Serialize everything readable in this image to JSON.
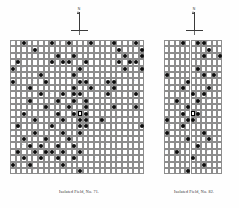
{
  "figure": {
    "background_color": "#ffffff",
    "grid_line_color": "#8d8d8d",
    "dot_color": "#0d0d0d",
    "focus_marker_color": "#000000",
    "caption_color": "#2b2b2b"
  },
  "panels": [
    {
      "id": "left",
      "caption": "Isolated Field, No. 71.",
      "north_arrow": {
        "label": "N",
        "icon": "north-arrow-icon"
      },
      "grid": {
        "columns": 24,
        "rows": 21,
        "cell_width": 5.6,
        "cell_height": 6.4,
        "origin_x": 0,
        "origin_y": 0
      },
      "focus_cell": {
        "col": 12,
        "row": 11
      },
      "cell_labels": [
        {
          "col": 0,
          "row": 0,
          "text": "a"
        },
        {
          "col": 3,
          "row": 0,
          "text": "b"
        },
        {
          "col": 6,
          "row": 0,
          "text": "c"
        },
        {
          "col": 9,
          "row": 0,
          "text": "d"
        },
        {
          "col": 14,
          "row": 0,
          "text": "e"
        },
        {
          "col": 18,
          "row": 0,
          "text": "f"
        },
        {
          "col": 21,
          "row": 0,
          "text": "g"
        },
        {
          "col": 1,
          "row": 2,
          "text": "h"
        },
        {
          "col": 5,
          "row": 2,
          "text": "i"
        },
        {
          "col": 11,
          "row": 2,
          "text": "j"
        },
        {
          "col": 16,
          "row": 2,
          "text": "k"
        },
        {
          "col": 20,
          "row": 2,
          "text": "l"
        },
        {
          "col": 2,
          "row": 4,
          "text": "m"
        },
        {
          "col": 8,
          "row": 4,
          "text": "n"
        },
        {
          "col": 13,
          "row": 4,
          "text": "o"
        },
        {
          "col": 19,
          "row": 4,
          "text": "p"
        },
        {
          "col": 0,
          "row": 6,
          "text": "q"
        },
        {
          "col": 4,
          "row": 6,
          "text": "r"
        },
        {
          "col": 10,
          "row": 6,
          "text": "s"
        },
        {
          "col": 17,
          "row": 6,
          "text": "t"
        },
        {
          "col": 22,
          "row": 6,
          "text": "u"
        },
        {
          "col": 2,
          "row": 8,
          "text": "v"
        },
        {
          "col": 7,
          "row": 8,
          "text": "w"
        },
        {
          "col": 15,
          "row": 8,
          "text": "x"
        },
        {
          "col": 20,
          "row": 8,
          "text": "y"
        },
        {
          "col": 1,
          "row": 10,
          "text": "z"
        },
        {
          "col": 6,
          "row": 10,
          "text": "a"
        },
        {
          "col": 16,
          "row": 10,
          "text": "b"
        },
        {
          "col": 21,
          "row": 10,
          "text": "c"
        },
        {
          "col": 3,
          "row": 12,
          "text": "d"
        },
        {
          "col": 9,
          "row": 12,
          "text": "e"
        },
        {
          "col": 14,
          "row": 12,
          "text": "f"
        },
        {
          "col": 19,
          "row": 12,
          "text": "g"
        },
        {
          "col": 0,
          "row": 14,
          "text": "h"
        },
        {
          "col": 5,
          "row": 14,
          "text": "i"
        },
        {
          "col": 12,
          "row": 14,
          "text": "j"
        },
        {
          "col": 18,
          "row": 14,
          "text": "k"
        },
        {
          "col": 22,
          "row": 14,
          "text": "l"
        },
        {
          "col": 2,
          "row": 16,
          "text": "m"
        },
        {
          "col": 8,
          "row": 16,
          "text": "n"
        },
        {
          "col": 13,
          "row": 16,
          "text": "o"
        },
        {
          "col": 17,
          "row": 16,
          "text": "p"
        },
        {
          "col": 21,
          "row": 16,
          "text": "q"
        },
        {
          "col": 1,
          "row": 18,
          "text": "r"
        },
        {
          "col": 6,
          "row": 18,
          "text": "s"
        },
        {
          "col": 11,
          "row": 18,
          "text": "t"
        },
        {
          "col": 15,
          "row": 18,
          "text": "u"
        },
        {
          "col": 19,
          "row": 18,
          "text": "v"
        },
        {
          "col": 4,
          "row": 20,
          "text": "w"
        },
        {
          "col": 10,
          "row": 20,
          "text": "x"
        },
        {
          "col": 16,
          "row": 20,
          "text": "y"
        }
      ],
      "marked_cells": [
        {
          "col": 2,
          "row": 0
        },
        {
          "col": 7,
          "row": 0
        },
        {
          "col": 10,
          "row": 0
        },
        {
          "col": 14,
          "row": 0
        },
        {
          "col": 18,
          "row": 0
        },
        {
          "col": 22,
          "row": 0
        },
        {
          "col": 4,
          "row": 1
        },
        {
          "col": 19,
          "row": 1
        },
        {
          "col": 23,
          "row": 1
        },
        {
          "col": 8,
          "row": 2
        },
        {
          "col": 11,
          "row": 2
        },
        {
          "col": 20,
          "row": 2
        },
        {
          "col": 23,
          "row": 2
        },
        {
          "col": 1,
          "row": 3
        },
        {
          "col": 7,
          "row": 3
        },
        {
          "col": 9,
          "row": 3
        },
        {
          "col": 10,
          "row": 3
        },
        {
          "col": 13,
          "row": 3
        },
        {
          "col": 19,
          "row": 3
        },
        {
          "col": 21,
          "row": 3
        },
        {
          "col": 22,
          "row": 3
        },
        {
          "col": 0,
          "row": 4
        },
        {
          "col": 12,
          "row": 4
        },
        {
          "col": 20,
          "row": 4
        },
        {
          "col": 23,
          "row": 4
        },
        {
          "col": 5,
          "row": 5
        },
        {
          "col": 11,
          "row": 5
        },
        {
          "col": 0,
          "row": 6
        },
        {
          "col": 6,
          "row": 6
        },
        {
          "col": 12,
          "row": 6
        },
        {
          "col": 13,
          "row": 6
        },
        {
          "col": 17,
          "row": 6
        },
        {
          "col": 18,
          "row": 6
        },
        {
          "col": 3,
          "row": 7
        },
        {
          "col": 11,
          "row": 7
        },
        {
          "col": 14,
          "row": 7
        },
        {
          "col": 18,
          "row": 7
        },
        {
          "col": 5,
          "row": 8
        },
        {
          "col": 9,
          "row": 8
        },
        {
          "col": 11,
          "row": 8
        },
        {
          "col": 12,
          "row": 8
        },
        {
          "col": 17,
          "row": 8
        },
        {
          "col": 22,
          "row": 8
        },
        {
          "col": 3,
          "row": 9
        },
        {
          "col": 8,
          "row": 9
        },
        {
          "col": 11,
          "row": 9
        },
        {
          "col": 13,
          "row": 9
        },
        {
          "col": 6,
          "row": 10
        },
        {
          "col": 10,
          "row": 10
        },
        {
          "col": 13,
          "row": 10
        },
        {
          "col": 18,
          "row": 10
        },
        {
          "col": 22,
          "row": 10
        },
        {
          "col": 2,
          "row": 11
        },
        {
          "col": 8,
          "row": 11
        },
        {
          "col": 11,
          "row": 11
        },
        {
          "col": 13,
          "row": 11
        },
        {
          "col": 4,
          "row": 12
        },
        {
          "col": 9,
          "row": 12
        },
        {
          "col": 12,
          "row": 12
        },
        {
          "col": 13,
          "row": 12
        },
        {
          "col": 16,
          "row": 12
        },
        {
          "col": 1,
          "row": 13
        },
        {
          "col": 7,
          "row": 13
        },
        {
          "col": 12,
          "row": 13
        },
        {
          "col": 13,
          "row": 13
        },
        {
          "col": 23,
          "row": 13
        },
        {
          "col": 4,
          "row": 14
        },
        {
          "col": 9,
          "row": 14
        },
        {
          "col": 12,
          "row": 14
        },
        {
          "col": 2,
          "row": 15
        },
        {
          "col": 6,
          "row": 15
        },
        {
          "col": 10,
          "row": 15
        },
        {
          "col": 3,
          "row": 16
        },
        {
          "col": 5,
          "row": 16
        },
        {
          "col": 8,
          "row": 16
        },
        {
          "col": 11,
          "row": 16
        },
        {
          "col": 1,
          "row": 17
        },
        {
          "col": 4,
          "row": 17
        },
        {
          "col": 6,
          "row": 17
        },
        {
          "col": 7,
          "row": 17
        },
        {
          "col": 9,
          "row": 17
        },
        {
          "col": 12,
          "row": 17
        },
        {
          "col": 2,
          "row": 18
        },
        {
          "col": 5,
          "row": 18
        },
        {
          "col": 8,
          "row": 18
        },
        {
          "col": 11,
          "row": 18
        },
        {
          "col": 0,
          "row": 19
        },
        {
          "col": 3,
          "row": 19
        },
        {
          "col": 9,
          "row": 19
        },
        {
          "col": 12,
          "row": 20
        }
      ]
    },
    {
      "id": "right",
      "caption": "Isolated Field, No. 82.",
      "north_arrow": {
        "label": "N",
        "icon": "north-arrow-icon"
      },
      "grid": {
        "columns": 11,
        "rows": 21,
        "cell_width": 5.3,
        "cell_height": 6.4,
        "origin_x": 0,
        "origin_y": 0
      },
      "focus_cell": {
        "col": 5,
        "row": 11
      },
      "cell_labels": [
        {
          "col": 0,
          "row": 1,
          "text": "a"
        },
        {
          "col": 8,
          "row": 0,
          "text": "b"
        },
        {
          "col": 2,
          "row": 3,
          "text": "c"
        },
        {
          "col": 6,
          "row": 3,
          "text": "d"
        },
        {
          "col": 0,
          "row": 5,
          "text": "e"
        },
        {
          "col": 3,
          "row": 5,
          "text": "f"
        },
        {
          "col": 7,
          "row": 5,
          "text": "g"
        },
        {
          "col": 1,
          "row": 7,
          "text": "h"
        },
        {
          "col": 5,
          "row": 7,
          "text": "i"
        },
        {
          "col": 9,
          "row": 7,
          "text": "j"
        },
        {
          "col": 0,
          "row": 9,
          "text": "k"
        },
        {
          "col": 4,
          "row": 9,
          "text": "l"
        },
        {
          "col": 8,
          "row": 9,
          "text": "m"
        },
        {
          "col": 2,
          "row": 11,
          "text": "n"
        },
        {
          "col": 7,
          "row": 11,
          "text": "o"
        },
        {
          "col": 1,
          "row": 13,
          "text": "p"
        },
        {
          "col": 5,
          "row": 13,
          "text": "q"
        },
        {
          "col": 9,
          "row": 13,
          "text": "r"
        },
        {
          "col": 3,
          "row": 15,
          "text": "s"
        },
        {
          "col": 7,
          "row": 15,
          "text": "t"
        },
        {
          "col": 0,
          "row": 17,
          "text": "u"
        },
        {
          "col": 4,
          "row": 17,
          "text": "v"
        },
        {
          "col": 8,
          "row": 17,
          "text": "w"
        },
        {
          "col": 2,
          "row": 19,
          "text": "x"
        },
        {
          "col": 6,
          "row": 19,
          "text": "y"
        }
      ],
      "marked_cells": [
        {
          "col": 3,
          "row": 0
        },
        {
          "col": 6,
          "row": 0
        },
        {
          "col": 7,
          "row": 0
        },
        {
          "col": 8,
          "row": 1
        },
        {
          "col": 7,
          "row": 2
        },
        {
          "col": 10,
          "row": 2
        },
        {
          "col": 6,
          "row": 4
        },
        {
          "col": 0,
          "row": 5
        },
        {
          "col": 7,
          "row": 5
        },
        {
          "col": 9,
          "row": 5
        },
        {
          "col": 4,
          "row": 6
        },
        {
          "col": 3,
          "row": 7
        },
        {
          "col": 8,
          "row": 7
        },
        {
          "col": 5,
          "row": 8
        },
        {
          "col": 7,
          "row": 8
        },
        {
          "col": 2,
          "row": 9
        },
        {
          "col": 6,
          "row": 9
        },
        {
          "col": 4,
          "row": 10
        },
        {
          "col": 3,
          "row": 11
        },
        {
          "col": 6,
          "row": 11
        },
        {
          "col": 0,
          "row": 12
        },
        {
          "col": 4,
          "row": 12
        },
        {
          "col": 5,
          "row": 12
        },
        {
          "col": 3,
          "row": 13
        },
        {
          "col": 0,
          "row": 14
        },
        {
          "col": 7,
          "row": 14
        },
        {
          "col": 4,
          "row": 15
        },
        {
          "col": 8,
          "row": 15
        },
        {
          "col": 6,
          "row": 16
        },
        {
          "col": 2,
          "row": 17
        },
        {
          "col": 5,
          "row": 18
        },
        {
          "col": 7,
          "row": 19
        },
        {
          "col": 4,
          "row": 20
        }
      ]
    }
  ]
}
